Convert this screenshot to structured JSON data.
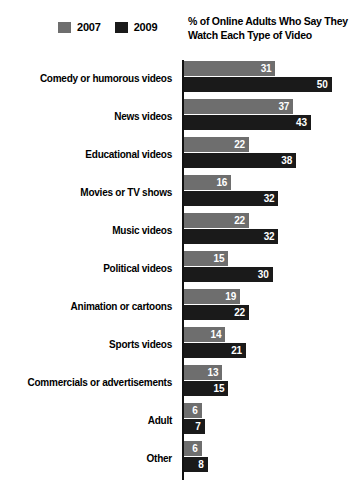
{
  "chart_data": {
    "type": "bar",
    "orientation": "horizontal",
    "title": "% of Online Adults Who Say They Watch Each Type of Video",
    "xlabel": "",
    "ylabel": "",
    "xlim": [
      0,
      50
    ],
    "grid": false,
    "legend_position": "top-left",
    "categories": [
      "Comedy or humorous videos",
      "News videos",
      "Educational videos",
      "Movies or TV shows",
      "Music videos",
      "Political videos",
      "Animation or cartoons",
      "Sports videos",
      "Commercials or advertisements",
      "Adult",
      "Other"
    ],
    "series": [
      {
        "name": "2007",
        "color": "#6e6e6e",
        "values": [
          31,
          37,
          22,
          16,
          22,
          15,
          19,
          14,
          13,
          6,
          6
        ]
      },
      {
        "name": "2009",
        "color": "#1a1a1a",
        "values": [
          50,
          43,
          38,
          32,
          32,
          30,
          22,
          21,
          15,
          7,
          8
        ]
      }
    ]
  },
  "legend": {
    "entries": [
      {
        "label": "2007",
        "color": "#6e6e6e"
      },
      {
        "label": "2009",
        "color": "#1a1a1a"
      }
    ]
  },
  "colors": {
    "series_2007": "#6e6e6e",
    "series_2009": "#1a1a1a",
    "axis": "#111111",
    "value_label": "#ffffff",
    "background": "#ffffff"
  }
}
